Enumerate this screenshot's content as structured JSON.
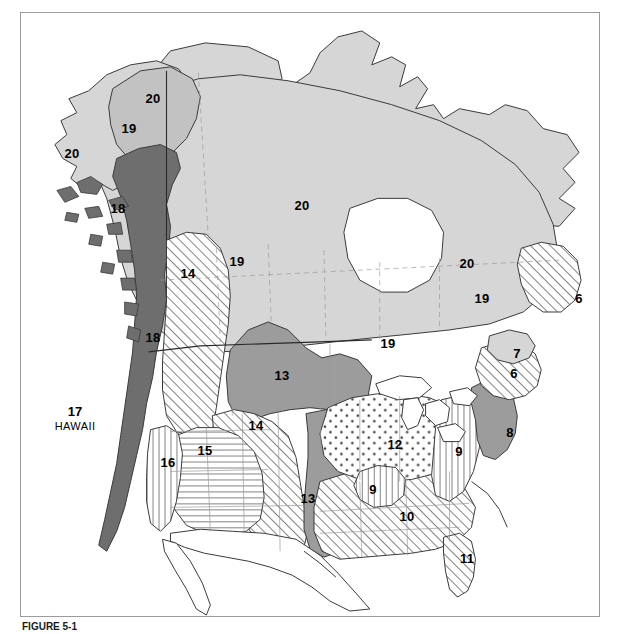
{
  "figure": {
    "caption_label": "FIGURE 5-1",
    "caption_text": ""
  },
  "colors": {
    "zone_light_gray": "#d6d6d6",
    "zone_mid_gray": "#9c9c9c",
    "zone_dark_gray": "#6e6e6e",
    "zone_white": "#ffffff",
    "outline": "#3a3a3a",
    "state_border": "#9a9a9a",
    "frame": "#9b9b9b",
    "hatch": "#5a5a5a",
    "dot": "#3a3a3a"
  },
  "legend_patterns": {
    "6": "diagonal-hatch",
    "7": "light-gray",
    "8": "mid-gray",
    "9": "vertical-hatch",
    "10": "diagonal-hatch",
    "11": "diagonal-hatch",
    "12": "dotted",
    "13": "mid-gray",
    "14": "diagonal-hatch",
    "15": "horizontal-hatch",
    "16": "vertical-hatch",
    "17": "none",
    "18": "dark-gray",
    "19": "mid-light-gray",
    "20": "light-gray"
  },
  "labels": [
    {
      "id": "label-20-yukon",
      "text": "20",
      "x": 152,
      "y": 97
    },
    {
      "id": "label-19-alaska",
      "text": "19",
      "x": 128,
      "y": 127
    },
    {
      "id": "label-20-alaska",
      "text": "20",
      "x": 71,
      "y": 152
    },
    {
      "id": "label-18-alaska",
      "text": "18",
      "x": 117,
      "y": 207
    },
    {
      "id": "label-20-arctic",
      "text": "20",
      "x": 301,
      "y": 204
    },
    {
      "id": "label-19-prairie",
      "text": "19",
      "x": 236,
      "y": 260
    },
    {
      "id": "label-14-northwest",
      "text": "14",
      "x": 187,
      "y": 272
    },
    {
      "id": "label-20-quebec",
      "text": "20",
      "x": 466,
      "y": 262
    },
    {
      "id": "label-19-ontario",
      "text": "19",
      "x": 481,
      "y": 297
    },
    {
      "id": "label-6-labrador",
      "text": "6",
      "x": 578,
      "y": 297
    },
    {
      "id": "label-18-coast",
      "text": "18",
      "x": 152,
      "y": 336
    },
    {
      "id": "label-19-greatlks",
      "text": "19",
      "x": 387,
      "y": 342
    },
    {
      "id": "label-7-maritimes",
      "text": "7",
      "x": 516,
      "y": 352
    },
    {
      "id": "label-6-maritimes",
      "text": "6",
      "x": 513,
      "y": 372
    },
    {
      "id": "label-13-rockies",
      "text": "13",
      "x": 281,
      "y": 374
    },
    {
      "id": "label-8-northeast",
      "text": "8",
      "x": 509,
      "y": 431
    },
    {
      "id": "label-12-midwest",
      "text": "12",
      "x": 394,
      "y": 443
    },
    {
      "id": "label-14-greatbasn",
      "text": "14",
      "x": 255,
      "y": 424
    },
    {
      "id": "label-9-appalach",
      "text": "9",
      "x": 458,
      "y": 450
    },
    {
      "id": "label-15-basin",
      "text": "15",
      "x": 204,
      "y": 449
    },
    {
      "id": "label-16-california",
      "text": "16",
      "x": 167,
      "y": 461
    },
    {
      "id": "label-9-ozark",
      "text": "9",
      "x": 372,
      "y": 488
    },
    {
      "id": "label-13-texas",
      "text": "13",
      "x": 307,
      "y": 497
    },
    {
      "id": "label-10-south",
      "text": "10",
      "x": 406,
      "y": 515
    },
    {
      "id": "label-11-florida",
      "text": "11",
      "x": 466,
      "y": 557
    }
  ],
  "hawaii": {
    "number": "17",
    "name": "HAWAII",
    "x": 74,
    "y": 418
  }
}
